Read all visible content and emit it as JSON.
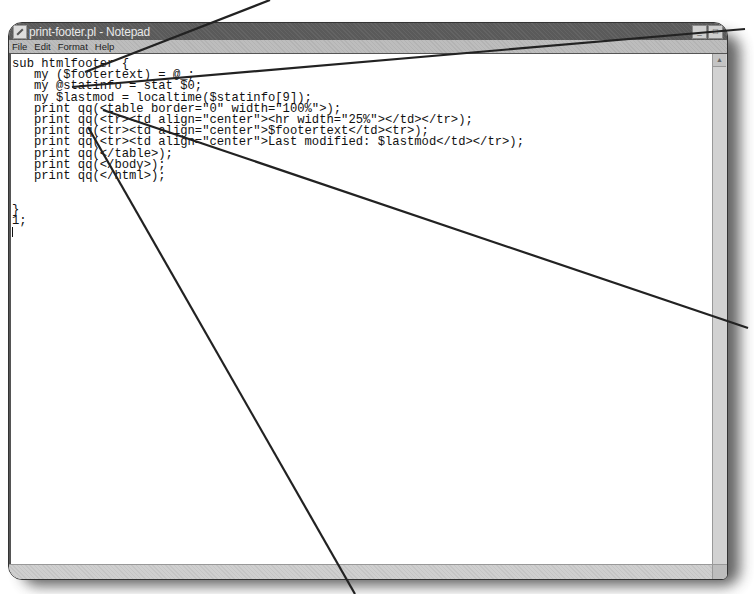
{
  "window": {
    "title": "print-footer.pl - Notepad",
    "controls": {
      "minimize": "_",
      "maximize": "□",
      "close": "×"
    }
  },
  "menu": {
    "items": [
      "File",
      "Edit",
      "Format",
      "Help"
    ]
  },
  "editor": {
    "lines": [
      "sub htmlfooter {",
      "   my ($footertext) = @_;",
      "   my @statinfo = stat $0;",
      "   my $lastmod = localtime($statinfo[9]);",
      "   print qq(<table border=\"0\" width=\"100%\">);",
      "   print qq(<tr><td align=\"center\"><hr width=\"25%\"></td></tr>);",
      "   print qq(<tr><td align=\"center\">$footertext</td><tr>);",
      "   print qq(<tr><td align=\"center\">Last modified: $lastmod</td></tr>);",
      "   print qq(</table>);",
      "   print qq(</body>);",
      "   print qq(</html>);",
      "",
      "",
      "}",
      "1;",
      ""
    ]
  },
  "callouts": [
    {
      "from": [
        270,
        0
      ],
      "to": [
        85,
        72
      ]
    },
    {
      "from": [
        745,
        29
      ],
      "to": [
        72,
        87
      ]
    },
    {
      "from": [
        748,
        328
      ],
      "to": [
        103,
        110
      ]
    },
    {
      "from": [
        355,
        594
      ],
      "to": [
        88,
        127
      ]
    }
  ],
  "colors": {
    "titlebar": "#5a5a5a",
    "menubar": "#bdbdbd",
    "text": "#111111",
    "callout": "#222222"
  }
}
